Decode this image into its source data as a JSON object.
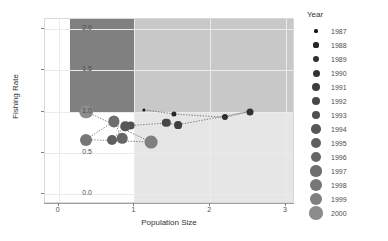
{
  "chart_data": {
    "type": "scatter",
    "title": "",
    "xlabel": "Population Size",
    "ylabel": "Fishing Rate",
    "xlim": [
      -0.18,
      3.12
    ],
    "ylim": [
      -0.12,
      2.12
    ],
    "xticks": [
      "0",
      "1",
      "2",
      "3"
    ],
    "xtick_values": [
      0,
      1,
      2,
      3
    ],
    "yticks": [
      "0.0",
      "0.5",
      "1.0",
      "1.5",
      "2.0"
    ],
    "ytick_values": [
      0.0,
      0.5,
      1.0,
      1.5,
      2.0
    ],
    "grid": true,
    "legend_title": "Year",
    "legend_position": "right",
    "connected": true,
    "line_style": "dotted",
    "quadrants": [
      {
        "name": "upper-left",
        "x0": 0.15,
        "x1": 1.0,
        "y0": 1.0,
        "y1": 2.12,
        "color": "#808080"
      },
      {
        "name": "upper-right",
        "x0": 1.0,
        "x1": 3.12,
        "y0": 1.0,
        "y1": 2.12,
        "color": "#c8c8c8"
      },
      {
        "name": "lower-left",
        "x0": 0.15,
        "x1": 1.0,
        "y0": -0.12,
        "y1": 1.0,
        "color": "#ffffff"
      },
      {
        "name": "lower-right",
        "x0": 1.0,
        "x1": 3.12,
        "y0": -0.12,
        "y1": 1.0,
        "color": "#e6e6e6"
      }
    ],
    "series": [
      {
        "name": "Stock trajectory",
        "points": [
          {
            "year": "1987",
            "x": 1.13,
            "y": 1.02,
            "size": 1.6,
            "color": "#1a1a1a"
          },
          {
            "year": "1988",
            "x": 1.52,
            "y": 0.97,
            "size": 2.6,
            "color": "#262626"
          },
          {
            "year": "1989",
            "x": 2.2,
            "y": 0.93,
            "size": 3.1,
            "color": "#2e2e2e"
          },
          {
            "year": "1990",
            "x": 2.52,
            "y": 1.0,
            "size": 3.5,
            "color": "#333333"
          },
          {
            "year": "1991",
            "x": 1.58,
            "y": 0.84,
            "size": 3.9,
            "color": "#3d3d3d"
          },
          {
            "year": "1992",
            "x": 1.42,
            "y": 0.86,
            "size": 4.2,
            "color": "#474747"
          },
          {
            "year": "1993",
            "x": 0.95,
            "y": 0.83,
            "size": 4.4,
            "color": "#4f4f4f"
          },
          {
            "year": "1994",
            "x": 0.88,
            "y": 0.82,
            "size": 4.7,
            "color": "#575757"
          },
          {
            "year": "1995",
            "x": 0.7,
            "y": 0.66,
            "size": 5.0,
            "color": "#5e5e5e"
          },
          {
            "year": "1996",
            "x": 0.84,
            "y": 0.68,
            "size": 5.3,
            "color": "#666666"
          },
          {
            "year": "1997",
            "x": 0.73,
            "y": 0.88,
            "size": 5.6,
            "color": "#6e6e6e"
          },
          {
            "year": "1998",
            "x": 0.36,
            "y": 0.66,
            "size": 6.0,
            "color": "#767676"
          },
          {
            "year": "1999",
            "x": 1.22,
            "y": 0.63,
            "size": 6.4,
            "color": "#7f7f7f"
          },
          {
            "year": "2000",
            "x": 0.36,
            "y": 1.0,
            "size": 6.8,
            "color": "#8c8c8c"
          }
        ]
      }
    ],
    "legend_entries": [
      {
        "label": "1987",
        "size": 1.6,
        "color": "#1a1a1a"
      },
      {
        "label": "1988",
        "size": 2.6,
        "color": "#262626"
      },
      {
        "label": "1989",
        "size": 3.1,
        "color": "#2e2e2e"
      },
      {
        "label": "1990",
        "size": 3.5,
        "color": "#333333"
      },
      {
        "label": "1991",
        "size": 3.9,
        "color": "#3d3d3d"
      },
      {
        "label": "1992",
        "size": 4.2,
        "color": "#474747"
      },
      {
        "label": "1993",
        "size": 4.4,
        "color": "#4f4f4f"
      },
      {
        "label": "1994",
        "size": 4.7,
        "color": "#575757"
      },
      {
        "label": "1995",
        "size": 5.0,
        "color": "#5e5e5e"
      },
      {
        "label": "1996",
        "size": 5.3,
        "color": "#666666"
      },
      {
        "label": "1997",
        "size": 5.6,
        "color": "#6e6e6e"
      },
      {
        "label": "1998",
        "size": 6.0,
        "color": "#767676"
      },
      {
        "label": "1999",
        "size": 6.4,
        "color": "#7f7f7f"
      },
      {
        "label": "2000",
        "size": 6.8,
        "color": "#8c8c8c"
      }
    ]
  }
}
